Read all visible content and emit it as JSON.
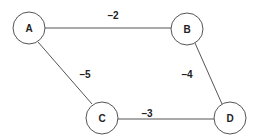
{
  "graph": {
    "nodes": [
      {
        "id": "A",
        "label": "A",
        "x": 29,
        "y": 28
      },
      {
        "id": "B",
        "label": "B",
        "x": 187,
        "y": 29
      },
      {
        "id": "C",
        "label": "C",
        "x": 102,
        "y": 118
      },
      {
        "id": "D",
        "label": "D",
        "x": 230,
        "y": 118
      }
    ],
    "edges": [
      {
        "from": "A",
        "to": "B",
        "weight": "–2"
      },
      {
        "from": "A",
        "to": "C",
        "weight": "–5"
      },
      {
        "from": "B",
        "to": "D",
        "weight": "–4"
      },
      {
        "from": "C",
        "to": "D",
        "weight": "–3"
      }
    ]
  }
}
